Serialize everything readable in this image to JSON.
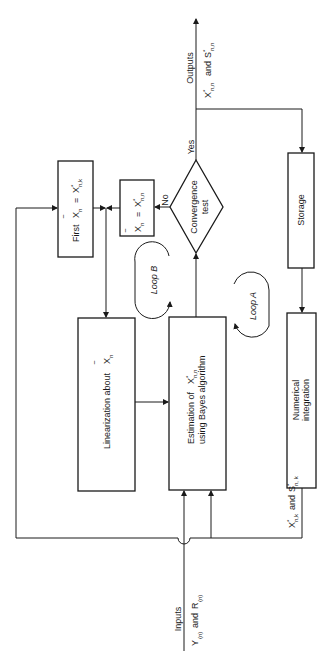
{
  "diagram": {
    "orientation": "rotated-90-ccw",
    "outputs": {
      "label": "Outputs",
      "values_label_main": "X",
      "values_label_sub": "n,n",
      "values_label_and": "and",
      "values_label_s": "S",
      "values_label_s_sub": "n,n"
    },
    "inputs": {
      "label": "Inputs",
      "y_label": "Y",
      "y_sub": "(n)",
      "and": "and",
      "r_label": "R",
      "r_sub": "(n)"
    },
    "nodes": {
      "first": {
        "prefix": "First",
        "lhs": "X",
        "lhs_sub": "n",
        "eq": "=",
        "rhs": "X",
        "rhs_sub": "n,k",
        "star": "*"
      },
      "update": {
        "lhs": "X",
        "lhs_sub": "n",
        "eq": "=",
        "rhs": "X",
        "rhs_sub": "n,n",
        "star": "*"
      },
      "convergence": {
        "line1": "Convergence",
        "line2": "test",
        "yes": "Yes",
        "no": "No"
      },
      "linearization": {
        "text": "Linearization about",
        "var": "X",
        "var_sub": "n"
      },
      "estimation": {
        "line1_pre": "Estimation of",
        "var": "X",
        "var_sub": "n,n",
        "star": "*",
        "line2": "using Bayes algorithm"
      },
      "storage": {
        "text": "Storage"
      },
      "integration": {
        "line1": "Numerical",
        "line2": "integration"
      }
    },
    "loops": {
      "a": {
        "label": "Loop A"
      },
      "b": {
        "label": "Loop B"
      }
    },
    "feedback": {
      "x_label": "X",
      "x_sub": "n,k",
      "and": "and",
      "s_label": "S",
      "s_sub": "n, k",
      "star": "*"
    }
  }
}
